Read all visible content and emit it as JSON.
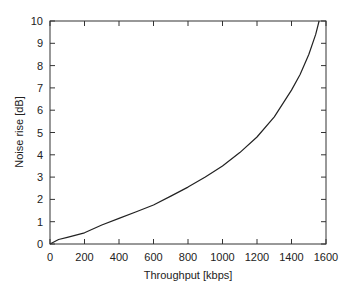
{
  "chart_data": {
    "type": "line",
    "title": "",
    "xlabel": "Throughput [kbps]",
    "ylabel": "Noise rise [dB]",
    "xlim": [
      0,
      1600
    ],
    "ylim": [
      0,
      10
    ],
    "xticks": [
      0,
      200,
      400,
      600,
      800,
      1000,
      1200,
      1400,
      1600
    ],
    "yticks": [
      0,
      1,
      2,
      3,
      4,
      5,
      6,
      7,
      8,
      9,
      10
    ],
    "grid": false,
    "legend": null,
    "series": [
      {
        "name": "Noise rise",
        "color": "#222222",
        "x": [
          0,
          50,
          100,
          200,
          300,
          400,
          500,
          600,
          700,
          800,
          900,
          1000,
          1100,
          1200,
          1300,
          1400,
          1450,
          1500,
          1540,
          1560
        ],
        "y": [
          0,
          0.2,
          0.3,
          0.5,
          0.85,
          1.15,
          1.45,
          1.75,
          2.15,
          2.55,
          3.0,
          3.5,
          4.1,
          4.8,
          5.7,
          6.9,
          7.6,
          8.5,
          9.4,
          10.0
        ]
      }
    ]
  }
}
